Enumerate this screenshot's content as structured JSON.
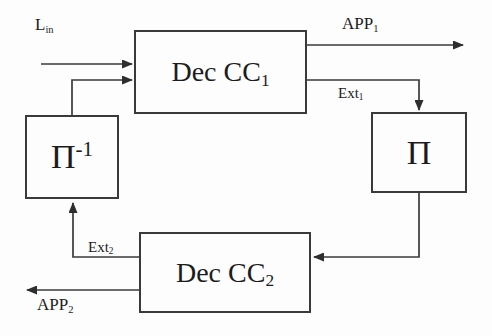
{
  "diagram": {
    "background_color": "#fdfdfd",
    "line_color": "#3a3a3a",
    "text_color": "#1c1c1c",
    "nodes": [
      {
        "id": "dec_cc1",
        "label_main": "Dec CC",
        "label_sub": "1",
        "label_sup": "",
        "name": "dec-cc1-block"
      },
      {
        "id": "pi",
        "label_main": "Π",
        "label_sub": "",
        "label_sup": "",
        "name": "interleaver-block"
      },
      {
        "id": "pi_inv",
        "label_main": "Π",
        "label_sub": "",
        "label_sup": "-1",
        "name": "deinterleaver-block"
      },
      {
        "id": "dec_cc2",
        "label_main": "Dec CC",
        "label_sub": "2",
        "label_sup": "",
        "name": "dec-cc2-block"
      }
    ],
    "wire_labels": [
      {
        "id": "l_in",
        "main": "L",
        "sub": "in",
        "name": "input-llr-label"
      },
      {
        "id": "app1",
        "main": "APP",
        "sub": "1",
        "name": "app1-output-label"
      },
      {
        "id": "ext1",
        "main": "Ext",
        "sub": "1",
        "name": "ext1-label"
      },
      {
        "id": "ext2",
        "main": "Ext",
        "sub": "2",
        "name": "ext2-label"
      },
      {
        "id": "app2",
        "main": "APP",
        "sub": "2",
        "name": "app2-output-label"
      }
    ]
  }
}
